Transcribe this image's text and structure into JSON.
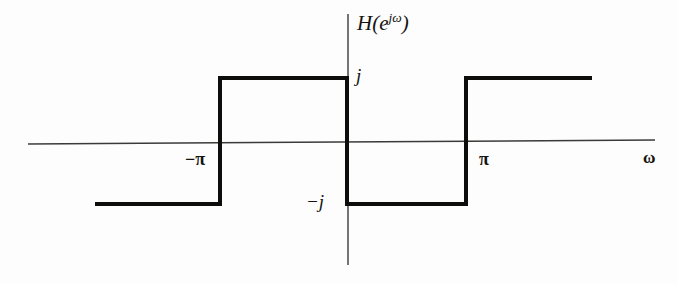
{
  "figure": {
    "background_color": "#fdfdfd",
    "axis_color": "#3a3a38",
    "curve_color": "#0d0d0b",
    "text_color": "#14130f",
    "curve_width": 4,
    "axis_width": 1.4
  },
  "labels": {
    "transfer_function": "H(e",
    "transfer_function_exponent": "jω",
    "transfer_function_close": ")",
    "j_positive": "j",
    "j_negative": "−j",
    "neg_pi": "−π",
    "pi": "π",
    "omega": "ω"
  },
  "chart_data": {
    "type": "line",
    "xlabel": "ω",
    "ylabel": "H(e^{jω})",
    "xlim": [
      -4.712,
      4.712
    ],
    "ylim": [
      -1.6,
      1.6
    ],
    "grid": false,
    "legend": null,
    "xticks": [
      -3.1416,
      0,
      3.1416
    ],
    "xticklabels": [
      "−π",
      "",
      "π"
    ],
    "yticks": [
      -1,
      1
    ],
    "yticklabels": [
      "−j",
      "j"
    ],
    "series": [
      {
        "name": "H(e^{jω})",
        "kind": "step",
        "x": [
          -4.42,
          -3.1416,
          -3.1416,
          0,
          0,
          3.1416,
          3.1416,
          4.42
        ],
        "y": [
          -1,
          -1,
          1,
          1,
          -1,
          -1,
          1,
          1
        ],
        "value_labels": [
          "-j",
          "-j",
          "j",
          "j",
          "-j",
          "-j",
          "j",
          "j"
        ]
      }
    ],
    "segments": [
      {
        "name": "left-low-level",
        "x_range": [
          -4.42,
          -3.1416
        ],
        "value": "-j"
      },
      {
        "name": "rise-at-neg-pi",
        "x": -3.1416,
        "from": "-j",
        "to": "j"
      },
      {
        "name": "mid-high-level",
        "x_range": [
          -3.1416,
          0
        ],
        "value": "j"
      },
      {
        "name": "fall-at-zero",
        "x": 0,
        "from": "j",
        "to": "-j"
      },
      {
        "name": "mid-low-level",
        "x_range": [
          0,
          3.1416
        ],
        "value": "-j"
      },
      {
        "name": "rise-at-pi",
        "x": 3.1416,
        "from": "-j",
        "to": "j"
      },
      {
        "name": "right-high-level",
        "x_range": [
          3.1416,
          4.42
        ],
        "value": "j"
      }
    ],
    "axes": {
      "x_axis_pixel_span": [
        28,
        655
      ],
      "y_axis_pixel_span": [
        14,
        265
      ],
      "origin_pixel": [
        348,
        143
      ]
    }
  },
  "geometry": {
    "x_axis": {
      "x1": 28,
      "y1": 144,
      "x2": 655,
      "y2": 140
    },
    "y_axis": {
      "x1": 348,
      "y1": 14,
      "x2": 348,
      "y2": 265
    },
    "level_top_y": 78,
    "level_bottom_y": 204,
    "step_x_left_end": 95,
    "step_x_neg_pi": 220,
    "step_x_zero": 347,
    "step_x_pi": 466,
    "step_x_right_end": 592,
    "path": "M 95 204 L 220 204 L 220 78 L 347 78 L 347 204 L 466 204 L 466 78 L 592 78"
  }
}
